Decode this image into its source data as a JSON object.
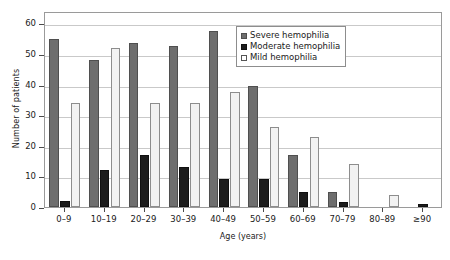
{
  "chart_data": {
    "type": "bar",
    "title": "",
    "subtitle": "",
    "xlabel": "Age (years)",
    "ylabel": "Number of patients",
    "categories": [
      "0–9",
      "10–19",
      "20–29",
      "30–39",
      "40–49",
      "50–59",
      "60–69",
      "70–79",
      "80–89",
      "≥90"
    ],
    "series": [
      {
        "name": "Severe hemophilia",
        "color": "#6e6e6e",
        "values": [
          55,
          48,
          53.5,
          52.5,
          57.5,
          39.5,
          17,
          5,
          0,
          0
        ]
      },
      {
        "name": "Moderate hemophilia",
        "color": "#1c1c1c",
        "values": [
          2,
          12,
          17,
          13,
          9,
          9,
          5,
          1.5,
          0,
          1
        ]
      },
      {
        "name": "Mild hemophilia",
        "color": "#f2f2f2",
        "values": [
          34,
          52,
          34,
          34,
          37.5,
          26,
          23,
          14,
          4,
          0
        ]
      }
    ],
    "ylim": [
      0,
      64
    ],
    "yticks": [
      0,
      10,
      20,
      30,
      40,
      50,
      60
    ],
    "ytick_labels": [
      "0",
      "10",
      "20",
      "30",
      "40",
      "50",
      "60"
    ],
    "grid": true,
    "grid_axis": "y",
    "legend_position": "top-right",
    "legend": [
      "Severe hemophilia",
      "Moderate hemophilia",
      "Mild hemophilia"
    ]
  }
}
